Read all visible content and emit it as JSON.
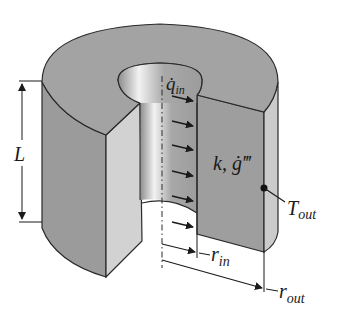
{
  "figure": {
    "colors": {
      "top_face": "#a3a3a3",
      "outer_side": "#9b9b9b",
      "cut_face_light": "#cfcfcf",
      "cut_face_dark": "#9e9e9e",
      "bore_wall": "#aaaaaa",
      "outline": "#2a2a2a",
      "background": "#ffffff"
    }
  },
  "labels": {
    "heat_flux": {
      "symbol": "q̇",
      "subscript": "in"
    },
    "properties": {
      "text": "k, ġ‴"
    },
    "outer_temp": {
      "symbol": "T",
      "subscript": "out"
    },
    "length": {
      "symbol": "L"
    },
    "inner_radius": {
      "symbol": "r",
      "subscript": "in"
    },
    "outer_radius": {
      "symbol": "r",
      "subscript": "out"
    }
  },
  "arrows": {
    "count": 6,
    "direction": "radially-outward-into-wall"
  }
}
